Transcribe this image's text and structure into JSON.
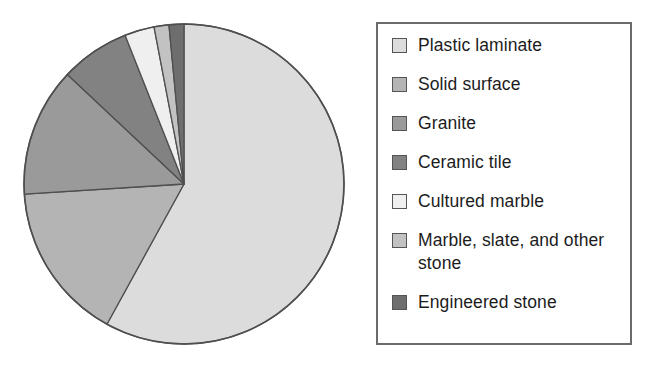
{
  "chart_data": {
    "type": "pie",
    "title": "",
    "subtitle": "",
    "xlabel": "",
    "ylabel": "",
    "grid": false,
    "legend_position": "right",
    "start_angle_deg": 0,
    "direction": "clockwise",
    "categories": [
      "Plastic laminate",
      "Solid surface",
      "Granite",
      "Ceramic tile",
      "Cultured marble",
      "Marble, slate, and other stone",
      "Engineered stone"
    ],
    "values": [
      58,
      16,
      13,
      7,
      3,
      1.5,
      1.5
    ],
    "unit": "percent",
    "colors": [
      "#dcdcdc",
      "#b4b4b4",
      "#9a9a9a",
      "#828282",
      "#efefef",
      "#c2c2c2",
      "#6e6e6e"
    ],
    "slices": [
      {
        "label": "Plastic laminate",
        "value": 58,
        "color": "#dcdcdc"
      },
      {
        "label": "Solid surface",
        "value": 16,
        "color": "#b4b4b4"
      },
      {
        "label": "Granite",
        "value": 13,
        "color": "#9a9a9a"
      },
      {
        "label": "Ceramic tile",
        "value": 7,
        "color": "#828282"
      },
      {
        "label": "Cultured marble",
        "value": 3,
        "color": "#efefef"
      },
      {
        "label": "Marble, slate, and other stone",
        "value": 1.5,
        "color": "#c2c2c2"
      },
      {
        "label": "Engineered stone",
        "value": 1.5,
        "color": "#6e6e6e"
      }
    ]
  },
  "legend": {
    "items": [
      {
        "label": "Plastic laminate",
        "color": "#dcdcdc"
      },
      {
        "label": "Solid surface",
        "color": "#b4b4b4"
      },
      {
        "label": "Granite",
        "color": "#9a9a9a"
      },
      {
        "label": "Ceramic tile",
        "color": "#828282"
      },
      {
        "label": "Cultured marble",
        "color": "#efefef"
      },
      {
        "label": "Marble, slate, and other stone",
        "color": "#c2c2c2"
      },
      {
        "label": "Engineered stone",
        "color": "#6e6e6e"
      }
    ]
  },
  "style": {
    "slice_outline": "#4f4f4f",
    "legend_border": "#6b6b6b",
    "background": "#ffffff",
    "text": "#1c1c1c"
  }
}
